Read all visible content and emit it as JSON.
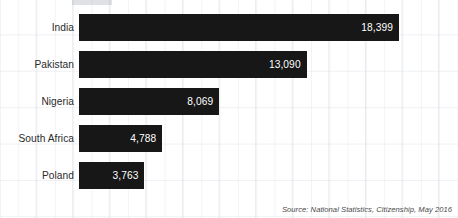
{
  "chart_data": {
    "type": "bar",
    "orientation": "horizontal",
    "title": "",
    "xlabel": "",
    "ylabel": "",
    "categories": [
      "India",
      "Pakistan",
      "Nigeria",
      "South Africa",
      "Poland"
    ],
    "values": [
      18399,
      13090,
      8069,
      4788,
      3763
    ],
    "value_labels": [
      "18,399",
      "13,090",
      "8,069",
      "4,788",
      "3,763"
    ],
    "xlim": [
      0,
      18399
    ],
    "grid": true,
    "legend": null,
    "bar_color": "#171717",
    "value_label_color": "#ffffff",
    "category_label_color": "#2b2b2b",
    "background_color": "#ffffff",
    "gridline_color": "#d6dbe2"
  },
  "footer": {
    "source": "Source: National Statistics, Citizenship, May 2016"
  }
}
